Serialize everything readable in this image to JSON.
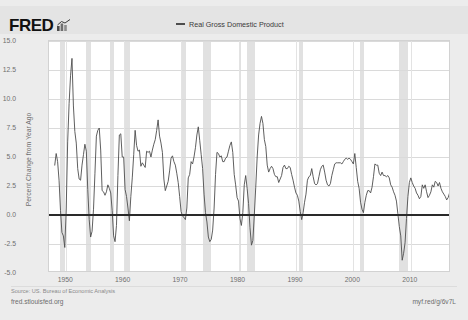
{
  "header": {
    "logo_text": "FRED",
    "logo_glyph_name": "bar-chart-glyph"
  },
  "legend": {
    "entries": [
      {
        "label": "Real Gross Domestic Product",
        "color": "#4d4d4d"
      }
    ]
  },
  "footer": {
    "source": "Source: US. Bureau of Economic Analysis",
    "site_url": "fred.stlouisfed.org",
    "short_url": "myf.red/g/6v7L"
  },
  "chart_data": {
    "type": "line",
    "title": "",
    "xlabel": "",
    "ylabel": "Percent Change from Year Ago",
    "xlim": [
      1947,
      2017
    ],
    "ylim": [
      -5.0,
      15.0
    ],
    "grid": true,
    "legend_position": "top-center",
    "yticks": [
      "15.0",
      "12.5",
      "10.0",
      "7.5",
      "5.0",
      "2.5",
      "0.0",
      "-2.5",
      "-5.0"
    ],
    "ytick_values": [
      15.0,
      12.5,
      10.0,
      7.5,
      5.0,
      2.5,
      0.0,
      -2.5,
      -5.0
    ],
    "xticks": [
      "1950",
      "1960",
      "1970",
      "1980",
      "1990",
      "2000",
      "2010"
    ],
    "xtick_values": [
      1950,
      1960,
      1970,
      1980,
      1990,
      2000,
      2010
    ],
    "zero_line": 0.0,
    "recession_bands": [
      {
        "start": 1948.9,
        "end": 1949.8
      },
      {
        "start": 1953.5,
        "end": 1954.4
      },
      {
        "start": 1957.6,
        "end": 1958.3
      },
      {
        "start": 1960.3,
        "end": 1961.1
      },
      {
        "start": 1969.9,
        "end": 1970.9
      },
      {
        "start": 1973.9,
        "end": 1975.2
      },
      {
        "start": 1980.0,
        "end": 1980.5
      },
      {
        "start": 1981.5,
        "end": 1982.9
      },
      {
        "start": 1990.6,
        "end": 1991.2
      },
      {
        "start": 2001.2,
        "end": 2001.9
      },
      {
        "start": 2007.9,
        "end": 2009.5
      }
    ],
    "series": [
      {
        "name": "Real Gross Domestic Product",
        "color": "#4d4d4d",
        "x": [
          1948.0,
          1948.25,
          1948.5,
          1948.75,
          1949.0,
          1949.25,
          1949.5,
          1949.75,
          1950.0,
          1950.25,
          1950.5,
          1950.75,
          1951.0,
          1951.25,
          1951.5,
          1951.75,
          1952.0,
          1952.25,
          1952.5,
          1952.75,
          1953.0,
          1953.25,
          1953.5,
          1953.75,
          1954.0,
          1954.25,
          1954.5,
          1954.75,
          1955.0,
          1955.25,
          1955.5,
          1955.75,
          1956.0,
          1956.25,
          1956.5,
          1956.75,
          1957.0,
          1957.25,
          1957.5,
          1957.75,
          1958.0,
          1958.25,
          1958.5,
          1958.75,
          1959.0,
          1959.25,
          1959.5,
          1959.75,
          1960.0,
          1960.25,
          1960.5,
          1960.75,
          1961.0,
          1961.25,
          1961.5,
          1961.75,
          1962.0,
          1962.25,
          1962.5,
          1962.75,
          1963.0,
          1963.25,
          1963.5,
          1963.75,
          1964.0,
          1964.25,
          1964.5,
          1964.75,
          1965.0,
          1965.25,
          1965.5,
          1965.75,
          1966.0,
          1966.25,
          1966.5,
          1966.75,
          1967.0,
          1967.25,
          1967.5,
          1967.75,
          1968.0,
          1968.25,
          1968.5,
          1968.75,
          1969.0,
          1969.25,
          1969.5,
          1969.75,
          1970.0,
          1970.25,
          1970.5,
          1970.75,
          1971.0,
          1971.25,
          1971.5,
          1971.75,
          1972.0,
          1972.25,
          1972.5,
          1972.75,
          1973.0,
          1973.25,
          1973.5,
          1973.75,
          1974.0,
          1974.25,
          1974.5,
          1974.75,
          1975.0,
          1975.25,
          1975.5,
          1975.75,
          1976.0,
          1976.25,
          1976.5,
          1976.75,
          1977.0,
          1977.25,
          1977.5,
          1977.75,
          1978.0,
          1978.25,
          1978.5,
          1978.75,
          1979.0,
          1979.25,
          1979.5,
          1979.75,
          1980.0,
          1980.25,
          1980.5,
          1980.75,
          1981.0,
          1981.25,
          1981.5,
          1981.75,
          1982.0,
          1982.25,
          1982.5,
          1982.75,
          1983.0,
          1983.25,
          1983.5,
          1983.75,
          1984.0,
          1984.25,
          1984.5,
          1984.75,
          1985.0,
          1985.25,
          1985.5,
          1985.75,
          1986.0,
          1986.25,
          1986.5,
          1986.75,
          1987.0,
          1987.25,
          1987.5,
          1987.75,
          1988.0,
          1988.25,
          1988.5,
          1988.75,
          1989.0,
          1989.25,
          1989.5,
          1989.75,
          1990.0,
          1990.25,
          1990.5,
          1990.75,
          1991.0,
          1991.25,
          1991.5,
          1991.75,
          1992.0,
          1992.25,
          1992.5,
          1992.75,
          1993.0,
          1993.25,
          1993.5,
          1993.75,
          1994.0,
          1994.25,
          1994.5,
          1994.75,
          1995.0,
          1995.25,
          1995.5,
          1995.75,
          1996.0,
          1996.25,
          1996.5,
          1996.75,
          1997.0,
          1997.25,
          1997.5,
          1997.75,
          1998.0,
          1998.25,
          1998.5,
          1998.75,
          1999.0,
          1999.25,
          1999.5,
          1999.75,
          2000.0,
          2000.25,
          2000.5,
          2000.75,
          2001.0,
          2001.25,
          2001.5,
          2001.75,
          2002.0,
          2002.25,
          2002.5,
          2002.75,
          2003.0,
          2003.25,
          2003.5,
          2003.75,
          2004.0,
          2004.25,
          2004.5,
          2004.75,
          2005.0,
          2005.25,
          2005.5,
          2005.75,
          2006.0,
          2006.25,
          2006.5,
          2006.75,
          2007.0,
          2007.25,
          2007.5,
          2007.75,
          2008.0,
          2008.25,
          2008.5,
          2008.75,
          2009.0,
          2009.25,
          2009.5,
          2009.75,
          2010.0,
          2010.25,
          2010.5,
          2010.75,
          2011.0,
          2011.25,
          2011.5,
          2011.75,
          2012.0,
          2012.25,
          2012.5,
          2012.75,
          2013.0,
          2013.25,
          2013.5,
          2013.75,
          2014.0,
          2014.25,
          2014.5,
          2014.75,
          2015.0,
          2015.25,
          2015.5,
          2015.75,
          2016.0,
          2016.25,
          2016.5,
          2016.75
        ],
        "values": [
          4.3,
          5.3,
          4.6,
          3.0,
          0.4,
          -1.5,
          -1.8,
          -2.8,
          0.6,
          6.3,
          9.6,
          12.0,
          13.5,
          9.4,
          7.2,
          6.2,
          4.0,
          3.1,
          3.0,
          4.3,
          5.2,
          6.1,
          5.5,
          2.2,
          -0.4,
          -1.9,
          -1.4,
          0.5,
          3.6,
          6.8,
          7.3,
          7.5,
          5.6,
          2.1,
          2.0,
          1.7,
          2.0,
          2.6,
          2.3,
          1.9,
          0.4,
          -1.8,
          -2.3,
          -0.9,
          3.4,
          6.9,
          7.0,
          5.0,
          5.0,
          2.2,
          1.6,
          0.6,
          -0.5,
          1.6,
          3.2,
          5.2,
          7.3,
          6.0,
          5.5,
          5.6,
          4.2,
          4.5,
          4.3,
          4.1,
          5.5,
          5.4,
          5.5,
          5.0,
          5.6,
          6.1,
          6.5,
          7.3,
          8.2,
          6.8,
          6.2,
          5.4,
          3.1,
          2.1,
          2.5,
          2.9,
          3.8,
          4.9,
          5.1,
          4.6,
          4.3,
          3.6,
          2.8,
          1.6,
          0.3,
          -0.1,
          -0.2,
          -0.4,
          0.6,
          3.2,
          3.5,
          4.6,
          4.4,
          5.0,
          5.8,
          6.9,
          7.6,
          6.4,
          5.2,
          4.0,
          1.8,
          0.2,
          -0.6,
          -1.9,
          -2.3,
          -2.1,
          -1.3,
          0.6,
          3.5,
          5.4,
          5.3,
          5.0,
          5.1,
          4.6,
          4.6,
          4.9,
          5.0,
          5.5,
          6.0,
          6.3,
          5.4,
          3.5,
          2.6,
          1.5,
          1.2,
          -0.3,
          -0.9,
          0.2,
          2.6,
          3.4,
          2.3,
          1.0,
          -1.1,
          -2.6,
          -2.2,
          0.0,
          2.4,
          5.0,
          6.9,
          7.9,
          8.5,
          7.9,
          6.5,
          5.9,
          4.3,
          3.7,
          4.0,
          4.2,
          4.0,
          3.5,
          3.3,
          3.3,
          2.8,
          3.1,
          3.4,
          4.1,
          4.3,
          4.0,
          4.0,
          4.2,
          4.1,
          3.5,
          3.0,
          2.4,
          1.9,
          1.7,
          1.2,
          0.3,
          -0.4,
          0.2,
          1.1,
          1.8,
          3.0,
          3.3,
          3.4,
          4.0,
          3.3,
          2.7,
          2.6,
          2.7,
          3.3,
          3.9,
          4.2,
          4.3,
          3.7,
          3.0,
          2.6,
          2.5,
          2.7,
          3.4,
          3.9,
          4.4,
          4.5,
          4.5,
          4.5,
          4.5,
          4.4,
          4.6,
          4.8,
          4.9,
          4.8,
          4.9,
          4.8,
          4.6,
          4.4,
          5.3,
          4.1,
          2.9,
          2.3,
          1.1,
          0.5,
          0.2,
          1.1,
          1.7,
          2.1,
          2.1,
          1.9,
          2.4,
          3.3,
          4.4,
          4.3,
          4.3,
          3.6,
          3.4,
          3.7,
          3.4,
          3.4,
          3.3,
          3.4,
          3.2,
          2.6,
          2.4,
          2.0,
          1.7,
          1.2,
          0.1,
          -1.0,
          -1.8,
          -3.9,
          -3.3,
          -2.4,
          -0.3,
          1.6,
          2.8,
          3.2,
          2.8,
          2.5,
          2.3,
          1.9,
          1.7,
          1.4,
          1.6,
          2.6,
          2.3,
          2.6,
          2.0,
          1.5,
          1.7,
          2.0,
          2.6,
          2.4,
          2.9,
          2.8,
          2.5,
          2.8,
          2.3,
          2.0,
          1.8,
          1.6,
          1.3,
          1.5,
          1.9
        ]
      }
    ]
  }
}
